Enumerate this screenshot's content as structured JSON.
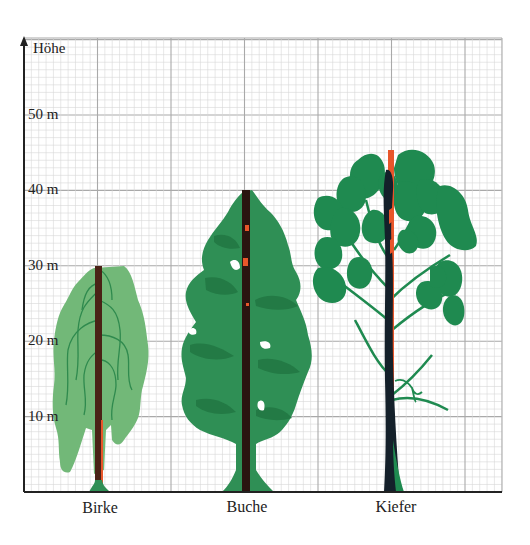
{
  "chart_data": {
    "type": "bar",
    "title": "",
    "ylabel": "Höhe",
    "xlabel": "",
    "unit": "m",
    "categories": [
      "Birke",
      "Buche",
      "Kiefer"
    ],
    "values": [
      30,
      40,
      45
    ],
    "yticks": [
      10,
      20,
      30,
      40,
      50
    ],
    "ytick_labels": [
      "10 m",
      "20 m",
      "30 m",
      "40 m",
      "50 m"
    ],
    "ylim": [
      0,
      60
    ],
    "grid": true,
    "legend": null
  },
  "axis": {
    "y_title": "Höhe",
    "ticks": [
      {
        "value": 50,
        "label": "50 m"
      },
      {
        "value": 40,
        "label": "40 m"
      },
      {
        "value": 30,
        "label": "30 m"
      },
      {
        "value": 20,
        "label": "20 m"
      },
      {
        "value": 10,
        "label": "10 m"
      }
    ]
  },
  "trees": [
    {
      "name": "Birke",
      "height_m": 30,
      "foliage_color": "#72b878",
      "branch_color": "#2f8a4e",
      "trunk_color": "#4a2216"
    },
    {
      "name": "Buche",
      "height_m": 40,
      "foliage_color": "#2f8f55",
      "shade_color": "#237a45",
      "trunk_color": "#2a1410"
    },
    {
      "name": "Kiefer",
      "height_m": 45,
      "foliage_color": "#1f8a50",
      "trunk_color": "#14202a",
      "measure_color": "#e8562a"
    }
  ],
  "colors": {
    "grid_minor": "#d6d6d6",
    "grid_major": "#a9a9a9",
    "axis": "#222222",
    "accent_measure": "#e8562a"
  }
}
